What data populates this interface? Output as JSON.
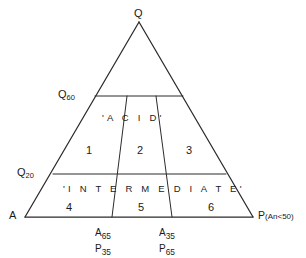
{
  "figure": {
    "type": "ternary-classification-diagram",
    "vertices": {
      "top": "Q",
      "bottom_left": "A",
      "bottom_right_main": "P",
      "bottom_right_qualifier": "(An<50)"
    },
    "left_axis_ticks": [
      {
        "id": "q60",
        "base": "Q",
        "sub": "60"
      },
      {
        "id": "q20",
        "base": "Q",
        "sub": "20"
      }
    ],
    "bottom_ticks": [
      {
        "id": "a65p35",
        "line1_base": "A",
        "line1_sub": "65",
        "line2_base": "P",
        "line2_sub": "35"
      },
      {
        "id": "a35p65",
        "line1_base": "A",
        "line1_sub": "35",
        "line2_base": "P",
        "line2_sub": "65"
      }
    ],
    "bands": [
      {
        "id": "acid",
        "text": "'A C I D'"
      },
      {
        "id": "intermediate",
        "text": "'I N T E R M E D I A T E'"
      }
    ],
    "fields": [
      {
        "id": "field-1",
        "label": "1"
      },
      {
        "id": "field-2",
        "label": "2"
      },
      {
        "id": "field-3",
        "label": "3"
      },
      {
        "id": "field-4",
        "label": "4"
      },
      {
        "id": "field-5",
        "label": "5"
      },
      {
        "id": "field-6",
        "label": "6"
      }
    ],
    "colors": {
      "ink": "#1a1a1a",
      "line": "#2b2b2b",
      "background": "#ffffff"
    }
  }
}
